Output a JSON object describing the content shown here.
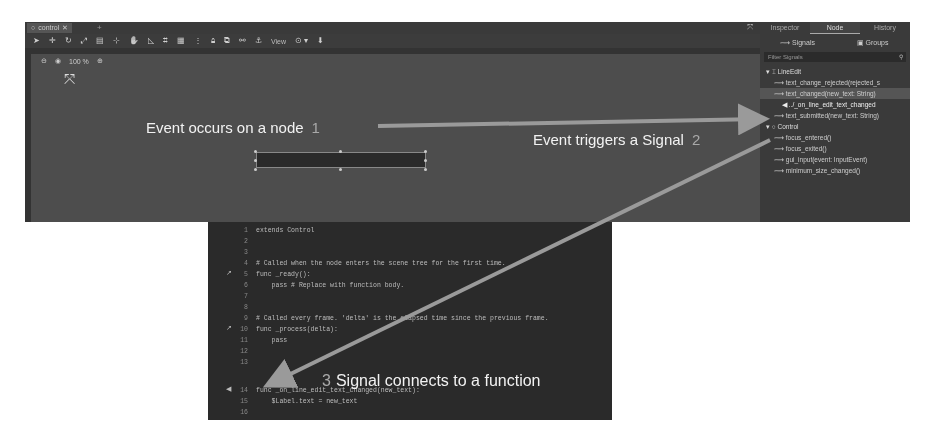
{
  "editor": {
    "tab": {
      "icon": "circle-node-icon",
      "label": "control",
      "close": "✕",
      "add": "+"
    },
    "toolbar": {
      "icons": [
        "select-icon",
        "move-icon",
        "rotate-icon",
        "scale-icon",
        "list-select-icon",
        "pivot-icon",
        "pan-icon",
        "ruler-icon",
        "snap-icon",
        "grid-icon",
        "more-icon",
        "lock-icon",
        "group-icon",
        "bone-icon",
        "anchor-icon"
      ],
      "view_label": "View",
      "zoom_label": "100 %"
    },
    "viewport": {
      "zoom_text": "100 %"
    }
  },
  "dock": {
    "tabs": [
      "Inspector",
      "Node",
      "History"
    ],
    "active_tab": "Node",
    "subtabs": {
      "signals": "Signals",
      "groups": "Groups"
    },
    "filter_placeholder": "Filter Signals",
    "groups": [
      {
        "name": "LineEdit",
        "signals": [
          {
            "label": "text_change_rejected(rejected_s",
            "connected": false
          },
          {
            "label": "text_changed(new_text: String)",
            "connected": false,
            "highlight": true
          },
          {
            "label": "../_on_line_edit_text_changed",
            "connected": true
          },
          {
            "label": "text_submitted(new_text: String)",
            "connected": false
          }
        ]
      },
      {
        "name": "Control",
        "signals": [
          {
            "label": "focus_entered()",
            "connected": false
          },
          {
            "label": "focus_exited()",
            "connected": false
          },
          {
            "label": "gui_input(event: InputEvent)",
            "connected": false
          },
          {
            "label": "minimum_size_changed()",
            "connected": false
          }
        ]
      }
    ]
  },
  "code": {
    "lines": [
      {
        "n": "1",
        "text": "extends Control"
      },
      {
        "n": "2",
        "text": ""
      },
      {
        "n": "3",
        "text": ""
      },
      {
        "n": "4",
        "text": "# Called when the node enters the scene tree for the first time."
      },
      {
        "n": "5",
        "text": "func _ready():",
        "gutter": "override-icon"
      },
      {
        "n": "6",
        "text": "    pass # Replace with function body."
      },
      {
        "n": "7",
        "text": ""
      },
      {
        "n": "8",
        "text": ""
      },
      {
        "n": "9",
        "text": "# Called every frame. 'delta' is the elapsed time since the previous frame."
      },
      {
        "n": "10",
        "text": "func _process(delta):",
        "gutter": "override-icon"
      },
      {
        "n": "11",
        "text": "    pass"
      },
      {
        "n": "12",
        "text": ""
      },
      {
        "n": "13",
        "text": ""
      },
      {
        "n": "14",
        "text": "func _on_line_edit_text_changed(new_text):",
        "gutter": "signal-connection-icon"
      },
      {
        "n": "15",
        "text": "    $Label.text = new_text"
      },
      {
        "n": "16",
        "text": ""
      }
    ]
  },
  "annotations": {
    "step1": {
      "text": "Event occurs on a node",
      "num": "1"
    },
    "step2": {
      "text": "Event triggers a Signal",
      "num": "2"
    },
    "step3": {
      "text": "Signal connects to a function",
      "num": "3"
    }
  },
  "colors": {
    "arrow": "#9a9a9a",
    "annotation_text": "#f2f2f2",
    "editor_bg": "#4a4a4a",
    "code_bg": "#2a2a2a"
  }
}
